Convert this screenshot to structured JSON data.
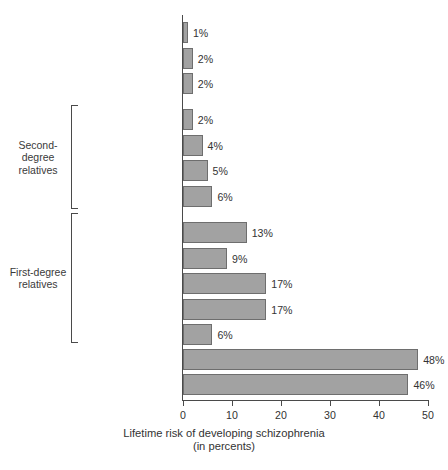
{
  "chart_data": {
    "type": "bar",
    "orientation": "horizontal",
    "title": "",
    "xlabel": "Lifetime risk of developing schizophrenia\n(in percents)",
    "ylabel": "",
    "xlim": [
      0,
      50
    ],
    "xticks": [
      0,
      10,
      20,
      30,
      40,
      50
    ],
    "grid": false,
    "legend": null,
    "value_suffix": "%",
    "categories": [
      "General population",
      "Spouses of patients",
      "First cousins\n(third degree)",
      "Uncles/Aunts",
      "Nephews/Nieces",
      "Grandchildren",
      "Half siblings",
      "Children",
      "Siblings",
      "Siblings with 1\nschizophrenic parent",
      "DZ twins",
      "Parents",
      "MZ twins",
      "Offspring of\ndual matings"
    ],
    "values": [
      1,
      2,
      2,
      2,
      4,
      5,
      6,
      13,
      9,
      17,
      17,
      6,
      48,
      46
    ],
    "value_labels": [
      "1%",
      "2%",
      "2%",
      "2%",
      "4%",
      "5%",
      "6%",
      "13%",
      "9%",
      "17%",
      "17%",
      "6%",
      "48%",
      "46%"
    ],
    "groups": [
      {
        "label": "Second-\ndegree\nrelatives",
        "from_index": 3,
        "to_index": 6
      },
      {
        "label": "First-degree\nrelatives",
        "from_index": 7,
        "to_index": 11
      }
    ],
    "colors": {
      "bar_fill": "#a2a2a2",
      "bar_stroke": "#6e6e6e",
      "axis": "#4a4a4a",
      "text": "#333333",
      "background": "#ffffff"
    }
  }
}
